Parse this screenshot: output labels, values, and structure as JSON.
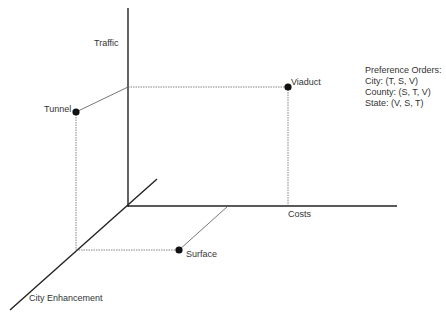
{
  "axes": {
    "traffic": "Traffic",
    "costs": "Costs",
    "city_enhancement": "City Enhancement"
  },
  "points": [
    {
      "id": "tunnel",
      "label": "Tunnel"
    },
    {
      "id": "viaduct",
      "label": "Viaduct"
    },
    {
      "id": "surface",
      "label": "Surface"
    }
  ],
  "legend": {
    "title": "Preference Orders:",
    "items": [
      "City: (T, S, V)",
      "County: (S, T, V)",
      "State: (V, S, T)"
    ]
  },
  "colors": {
    "axis": "#222222",
    "guide": "#666666",
    "point": "#111111"
  }
}
